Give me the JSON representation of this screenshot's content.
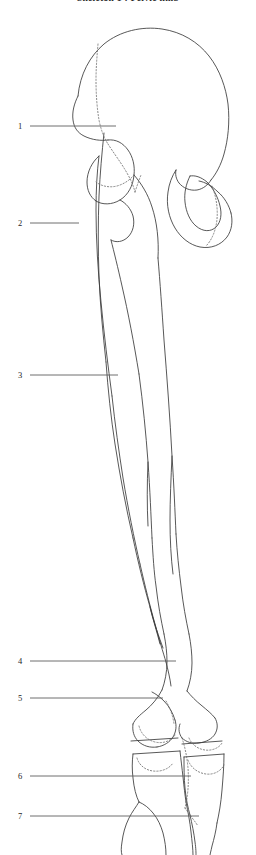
{
  "figure": {
    "title": "Skeleton 1 : Pelvic limb",
    "view_label": "lateral view",
    "line_color": "#3a3a3a",
    "hidden_line_color": "#6a6a6a",
    "leader_color": "#5d5d5d",
    "background": "#ffffff"
  },
  "labels": [
    {
      "number": "1",
      "x": 18,
      "y": 126,
      "leader_x1": 30,
      "leader_x2": 116,
      "leader_y": 126
    },
    {
      "number": "2",
      "x": 18,
      "y": 223,
      "leader_x1": 30,
      "leader_x2": 79,
      "leader_y": 223
    },
    {
      "number": "3",
      "x": 18,
      "y": 375,
      "leader_x1": 30,
      "leader_x2": 118,
      "leader_y": 375
    },
    {
      "number": "4",
      "x": 18,
      "y": 661,
      "leader_x1": 30,
      "leader_x2": 176,
      "leader_y": 661
    },
    {
      "number": "5",
      "x": 18,
      "y": 698,
      "leader_x1": 30,
      "leader_x2": 163,
      "leader_y": 698
    },
    {
      "number": "6",
      "x": 18,
      "y": 776,
      "leader_x1": 30,
      "leader_x2": 191,
      "leader_y": 776
    },
    {
      "number": "7",
      "x": 18,
      "y": 816,
      "leader_x1": 30,
      "leader_x2": 199,
      "leader_y": 816
    }
  ],
  "drawing": {
    "solid_paths": [
      "M 78 96 C 80 74, 90 56, 104 44 C 120 31, 142 26, 162 29 C 182 32, 198 42, 209 56 C 220 70, 226 88, 228 104 C 230 122, 228 140, 224 154 C 221 165, 216 174, 211 180",
      "M 78 96 C 74 104, 72 112, 73 120 C 74 128, 78 133, 84 136 C 92 140, 101 141, 108 140",
      "M 108 140 C 116 139, 123 143, 128 150 C 133 157, 135 166, 134 175 C 133 186, 128 195, 120 200 C 112 205, 102 205, 96 201",
      "M 96 201 C 90 197, 87 190, 87 182 C 87 172, 92 162, 99 156",
      "M 120 200 C 126 203, 131 209, 133 216 C 135 224, 133 232, 128 237 C 123 242, 116 243, 111 240",
      "M 211 180 C 208 185, 203 189, 197 190 C 190 191, 183 188, 179 183 C 176 179, 175 174, 176 170",
      "M 176 170 C 172 176, 169 184, 168 192 C 166 205, 169 218, 175 228 C 181 238, 190 245, 200 247 C 211 249, 221 245, 227 237 C 232 230, 233 221, 231 213",
      "M 231 213 C 229 205, 224 197, 218 192 C 212 186, 205 182, 199 181",
      "M 190 176 C 186 184, 184 193, 185 202 C 186 212, 190 221, 196 226 C 203 232, 211 232, 216 227 C 221 222, 222 214, 220 206 C 218 197, 213 188, 207 182 C 201 177, 195 175, 190 176",
      "M 134 175 C 141 183, 148 194, 152 207 C 157 222, 159 240, 158 258",
      "M 111 240 C 114 252, 118 268, 122 286 C 128 312, 134 343, 139 374",
      "M 99 156 C 97 172, 96 190, 96 210 C 96 240, 98 272, 101 302 C 104 334, 108 366, 112 396",
      "M 104 133 C 102 152, 100 174, 99 196 C 98 222, 98 250, 99 276 C 100 304, 103 334, 106 362",
      "M 158 258 C 160 282, 162 310, 164 340 C 167 378, 170 418, 172 456 C 174 486, 175 512, 176 534",
      "M 139 374 C 143 404, 146 434, 148 462 C 150 490, 151 516, 152 538",
      "M 112 396 C 115 424, 119 452, 123 478 C 128 508, 134 538, 140 564",
      "M 106 362 C 108 390, 111 418, 115 444 C 120 476, 126 508, 133 538",
      "M 152 538 C 153 556, 154 572, 156 586 C 158 604, 161 620, 164 634",
      "M 176 534 C 177 552, 179 570, 181 586 C 183 604, 186 620, 189 634",
      "M 140 564 C 145 586, 150 606, 155 624 C 159 639, 163 652, 166 662",
      "M 133 538 C 138 562, 144 586, 150 607 C 154 623, 159 637, 163 648",
      "M 164 634 C 166 644, 167 653, 167 662 C 167 672, 165 682, 162 690",
      "M 189 634 C 191 644, 192 654, 192 663 C 192 673, 190 683, 187 691",
      "M 162 690 C 158 698, 152 705, 146 710 C 140 715, 135 719, 133 724",
      "M 133 724 C 132 731, 134 737, 138 741 C 143 746, 150 748, 157 747",
      "M 157 747 C 164 746, 170 742, 173 737 C 176 732, 177 726, 175 720",
      "M 175 720 C 173 713, 169 706, 164 701 C 160 697, 156 694, 152 692",
      "M 187 691 C 191 696, 196 701, 201 705 C 207 710, 212 714, 215 718",
      "M 215 718 C 218 723, 218 729, 215 734 C 212 739, 206 742, 199 743 C 192 744, 186 742, 182 738",
      "M 182 738 C 179 734, 178 729, 180 724",
      "M 131 741 L 178 738",
      "M 133 754 L 180 751",
      "M 182 744 L 222 741",
      "M 184 757 L 224 754",
      "M 133 754 C 132 762, 132 770, 133 778 C 134 788, 136 796, 139 802",
      "M 180 751 C 181 760, 182 768, 183 777 C 184 787, 185 795, 186 802",
      "M 184 757 C 184 768, 184 778, 185 788 C 186 799, 188 808, 190 815",
      "M 224 754 C 224 766, 223 778, 222 790 C 221 803, 219 814, 217 823",
      "M 139 802 C 136 807, 132 812, 129 818 C 125 826, 123 834, 122 842 C 121 848, 121 852, 122 855",
      "M 139 802 C 144 804, 149 808, 153 813 C 158 819, 161 826, 163 833 C 165 841, 166 848, 166 855",
      "M 186 802 C 188 812, 190 822, 191 832 C 192 841, 193 849, 193 855",
      "M 190 815 C 192 824, 194 833, 195 842 C 196 849, 196 853, 196 855",
      "M 217 823 C 216 831, 214 839, 212 846 C 211 851, 210 854, 210 855",
      "M 172 456 C 171 478, 170 500, 170 520 C 170 540, 171 558, 173 574",
      "M 148 462 C 147 484, 147 506, 148 526",
      "M 166 662 C 168 670, 170 678, 171 686",
      "M 150 607 C 153 620, 157 632, 160 644"
    ],
    "hidden_paths": [
      "M 98 44 C 97 56, 96 68, 96 80 C 96 94, 97 108, 99 120 C 101 130, 104 138, 108 144",
      "M 108 144 C 113 152, 119 160, 124 168 C 129 176, 133 184, 135 192",
      "M 135 192 C 137 186, 139 180, 141 175",
      "M 134 175 C 130 180, 124 184, 117 186 C 109 188, 101 186, 96 182",
      "M 212 186 C 216 196, 218 208, 217 219 C 216 230, 212 240, 206 246",
      "M 139 726 C 141 734, 147 740, 155 742 C 163 744, 171 741, 175 735",
      "M 189 738 C 192 745, 198 749, 205 750 C 212 751, 219 748, 222 743",
      "M 137 758 C 139 765, 145 770, 153 771 C 161 772, 169 769, 173 763",
      "M 188 760 C 191 768, 198 773, 206 774 C 214 775, 221 771, 224 765",
      "M 182 738 C 185 747, 187 757, 188 768 C 189 782, 188 796, 185 808",
      "M 185 808 C 189 814, 194 820, 198 826",
      "M 166 701 C 170 708, 173 716, 174 724"
    ]
  }
}
